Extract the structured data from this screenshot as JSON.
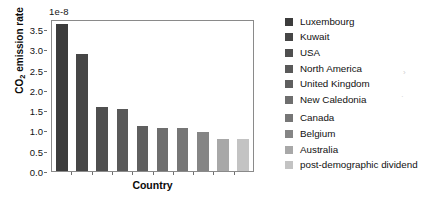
{
  "chart_data": {
    "type": "bar",
    "title": "",
    "subtitle": "",
    "xlabel": "Country",
    "ylabel": "CO2 emission rate",
    "ylabel_rich": "CO₂ emission rate",
    "offset_label": "1e-8",
    "categories": [
      "Luxembourg",
      "Kuwait",
      "USA",
      "North America",
      "United Kingdom",
      "New Caledonia",
      "Canada",
      "Belgium",
      "Australia",
      "post-demographic dividend"
    ],
    "values": [
      3.62,
      2.89,
      1.58,
      1.52,
      1.1,
      1.06,
      1.06,
      0.97,
      0.8,
      0.8
    ],
    "value_scale": "1e-8",
    "ylim": [
      0.0,
      3.75
    ],
    "xlim": [
      0,
      10
    ],
    "ytick_labels": [
      "0.0",
      "0.5",
      "1.0",
      "1.5",
      "2.0",
      "2.5",
      "3.0",
      "3.5"
    ],
    "ytick_values": [
      0.0,
      0.5,
      1.0,
      1.5,
      2.0,
      2.5,
      3.0,
      3.5
    ],
    "grid": false,
    "legend_position": "right",
    "bar_colors": [
      "#3c3c3c",
      "#464646",
      "#4f4f4f",
      "#595959",
      "#5f5f5f",
      "#6e6e6e",
      "#767676",
      "#858585",
      "#a8a8a8",
      "#c3c3c3"
    ],
    "legend_entries": [
      {
        "label": "Luxembourg",
        "color": "#3c3c3c"
      },
      {
        "label": "Kuwait",
        "color": "#464646"
      },
      {
        "label": "USA",
        "color": "#4f4f4f"
      },
      {
        "label": "North America",
        "color": "#595959"
      },
      {
        "label": "United Kingdom",
        "color": "#5f5f5f"
      },
      {
        "label": "New Caledonia",
        "color": "#6e6e6e"
      },
      {
        "label": "Canada",
        "color": "#767676"
      },
      {
        "label": "Belgium",
        "color": "#858585"
      },
      {
        "label": "Australia",
        "color": "#a8a8a8"
      },
      {
        "label": "post-demographic dividend",
        "color": "#c3c3c3"
      }
    ]
  }
}
